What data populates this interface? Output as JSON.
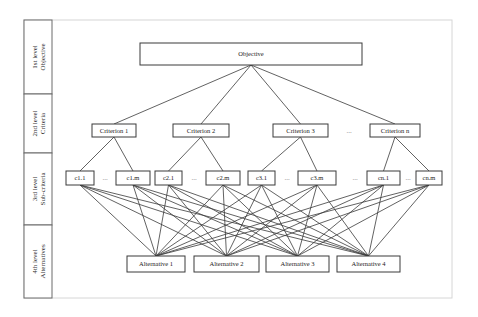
{
  "levels": [
    {
      "line1": "1st level",
      "line2": "Objective",
      "y0": 20,
      "y1": 94
    },
    {
      "line1": "2nd level",
      "line2": "Criteria",
      "y0": 94,
      "y1": 153
    },
    {
      "line1": "3rd level",
      "line2": "Sub-criteria",
      "y0": 153,
      "y1": 225
    },
    {
      "line1": "4th level",
      "line2": "Alternatives",
      "y0": 225,
      "y1": 298
    }
  ],
  "objective": {
    "label": "Objective",
    "x": 140,
    "y": 43,
    "w": 222,
    "h": 22
  },
  "criteria": [
    {
      "label": "Criterion 1",
      "x": 92,
      "y": 124,
      "w": 44,
      "h": 13
    },
    {
      "label": "Criterion 2",
      "x": 173,
      "y": 124,
      "w": 56,
      "h": 13
    },
    {
      "label": "Criterion 3",
      "x": 273,
      "y": 124,
      "w": 55,
      "h": 13
    },
    {
      "label": "Criterion n",
      "x": 370,
      "y": 124,
      "w": 50,
      "h": 13
    }
  ],
  "subcriteria": [
    {
      "label": "c1.1",
      "x": 66,
      "y": 171,
      "w": 28,
      "h": 14,
      "parent": 0
    },
    {
      "label": "c1.m",
      "x": 116,
      "y": 171,
      "w": 34,
      "h": 14,
      "parent": 0
    },
    {
      "label": "c2.1",
      "x": 155,
      "y": 171,
      "w": 27,
      "h": 14,
      "parent": 1
    },
    {
      "label": "c2.m",
      "x": 206,
      "y": 171,
      "w": 34,
      "h": 14,
      "parent": 1
    },
    {
      "label": "c3.1",
      "x": 248,
      "y": 171,
      "w": 27,
      "h": 14,
      "parent": 2
    },
    {
      "label": "c3.m",
      "x": 298,
      "y": 171,
      "w": 38,
      "h": 14,
      "parent": 2
    },
    {
      "label": "cn.1",
      "x": 367,
      "y": 171,
      "w": 33,
      "h": 14,
      "parent": 3
    },
    {
      "label": "cn.m",
      "x": 416,
      "y": 171,
      "w": 26,
      "h": 14,
      "parent": 3
    }
  ],
  "alternatives": [
    {
      "label": "Alternative 1",
      "x": 127,
      "y": 256,
      "w": 58,
      "h": 16
    },
    {
      "label": "Alternative 2",
      "x": 194,
      "y": 256,
      "w": 65,
      "h": 16
    },
    {
      "label": "Alternative 3",
      "x": 266,
      "y": 256,
      "w": 63,
      "h": 16
    },
    {
      "label": "Alternative 4",
      "x": 337,
      "y": 256,
      "w": 63,
      "h": 16
    }
  ],
  "ellipses": [
    {
      "text": "...",
      "x": 105,
      "y": 180
    },
    {
      "text": "...",
      "x": 194,
      "y": 180
    },
    {
      "text": "...",
      "x": 287,
      "y": 180
    },
    {
      "text": "...",
      "x": 355,
      "y": 180
    },
    {
      "text": "...",
      "x": 408,
      "y": 180
    },
    {
      "text": "...",
      "x": 349,
      "y": 133
    }
  ],
  "frame": {
    "x": 24,
    "y": 20,
    "w": 428,
    "h": 278,
    "label_col_w": 28
  },
  "colors": {
    "stroke": "#3a3a3a",
    "frame": "#d6d6d6",
    "background": "#ffffff"
  }
}
